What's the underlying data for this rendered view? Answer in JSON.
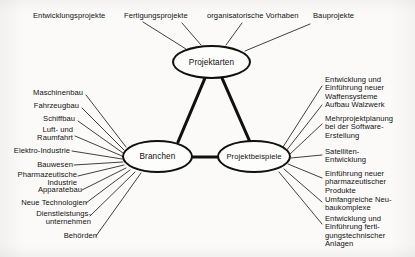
{
  "diagram": {
    "ink_color": "#101010",
    "background_color": "#fbfaf8"
  },
  "nodes": [
    {
      "id": "projektarten",
      "label": "Projektarten"
    },
    {
      "id": "branchen",
      "label": "Branchen"
    },
    {
      "id": "projektbeispiele",
      "label": "Projektbeispiele"
    }
  ],
  "top_labels": [
    {
      "text": "Entwicklungsprojekte"
    },
    {
      "text": "Fertigungsprojekte"
    },
    {
      "text": "organisatorische Vorhaben"
    },
    {
      "text": "Bauprojekte"
    }
  ],
  "left_labels": [
    {
      "text": "Maschinenbau"
    },
    {
      "text": "Fahrzeugbau"
    },
    {
      "text": "Schiffbau"
    },
    {
      "text": "Luft- und\nRaumfahrt"
    },
    {
      "text": "Elektro-Industrie"
    },
    {
      "text": "Bauwesen"
    },
    {
      "text": "Pharmazeutische\nIndustrie"
    },
    {
      "text": "Apparatebau"
    },
    {
      "text": "Neue Technologien"
    },
    {
      "text": "Dienstleistungs-\nunternehmen"
    },
    {
      "text": "Behörden"
    }
  ],
  "right_labels": [
    {
      "text": "Entwicklung und\nEinführung neuer\nWaffensysteme"
    },
    {
      "text": "Aufbau Walzwerk"
    },
    {
      "text": "Mehrprojektplanung\nbei der Software-\nErstellung"
    },
    {
      "text": "Satelliten-\nEntwicklung"
    },
    {
      "text": "Einführung neuer\npharmazeutischer\nProdukte"
    },
    {
      "text": "Umfangreiche Neu-\nbaukomplexe"
    },
    {
      "text": "Entwicklung und\nEinführung ferti-\ngungstechnischer\nAnlagen"
    }
  ]
}
